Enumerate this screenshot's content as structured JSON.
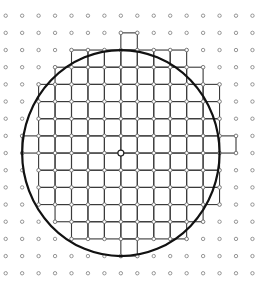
{
  "figure": {
    "lattice": {
      "columns": 16,
      "rows": 16,
      "origin_x": 5.7,
      "origin_y": 15.7,
      "step_x": 16.45,
      "step_y": 17.17,
      "dot_radius": 1.7,
      "dot_color": "#8a8a8a"
    },
    "circle": {
      "center_col": 7,
      "center_row": 8,
      "radius_units": 6,
      "stroke": "#111111",
      "stroke_width": 2.2
    },
    "center_point": {
      "col": 7,
      "row": 8,
      "radius": 3
    },
    "grid_stroke": "#3a3a3a",
    "row_extents": [
      {
        "row": 1,
        "from": 7,
        "to": 8
      },
      {
        "row": 2,
        "from": 4,
        "to": 11
      },
      {
        "row": 3,
        "from": 3,
        "to": 12
      },
      {
        "row": 4,
        "from": 2,
        "to": 13
      },
      {
        "row": 5,
        "from": 2,
        "to": 13
      },
      {
        "row": 6,
        "from": 2,
        "to": 13
      },
      {
        "row": 7,
        "from": 1,
        "to": 14
      },
      {
        "row": 8,
        "from": 1,
        "to": 14
      },
      {
        "row": 9,
        "from": 2,
        "to": 13
      },
      {
        "row": 10,
        "from": 2,
        "to": 13
      },
      {
        "row": 11,
        "from": 2,
        "to": 13
      },
      {
        "row": 12,
        "from": 3,
        "to": 12
      },
      {
        "row": 13,
        "from": 4,
        "to": 11
      },
      {
        "row": 14,
        "from": 7,
        "to": 8
      }
    ]
  }
}
